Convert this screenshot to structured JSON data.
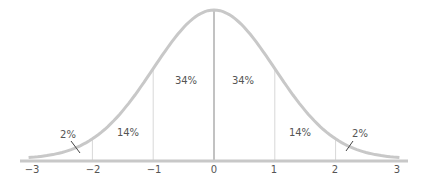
{
  "chart_data": {
    "type": "area",
    "title": "",
    "xlabel": "",
    "ylabel": "",
    "x_ticks": [
      "−3",
      "−2",
      "−1",
      "0",
      "1",
      "2",
      "3"
    ],
    "x_tick_values": [
      -3,
      -2,
      -1,
      0,
      1,
      2,
      3
    ],
    "xlim": [
      -3,
      3
    ],
    "grid": false,
    "legend": null,
    "bands": [
      {
        "from": -3,
        "to": -2,
        "label": "2%",
        "value": 2
      },
      {
        "from": -2,
        "to": -1,
        "label": "14%",
        "value": 14
      },
      {
        "from": -1,
        "to": 0,
        "label": "34%",
        "value": 34
      },
      {
        "from": 0,
        "to": 1,
        "label": "34%",
        "value": 34
      },
      {
        "from": 1,
        "to": 2,
        "label": "14%",
        "value": 14
      },
      {
        "from": 2,
        "to": 3,
        "label": "2%",
        "value": 2
      }
    ],
    "colors": {
      "curve": "#c8c8c8",
      "axis": "#c8c8c8",
      "divider": "#d8d8d8",
      "center_line": "#999999",
      "text": "#555555"
    }
  }
}
